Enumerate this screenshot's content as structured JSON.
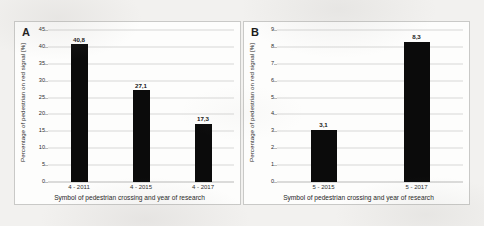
{
  "figure": {
    "background_color": "#f2f1ef",
    "bar_color": "#0b0b0b",
    "grid_color": "#d8d8d6"
  },
  "panels": [
    {
      "letter": "A",
      "ytitle": "Percentage of pedestrian on red signal [%]",
      "xtitle": "Symbol of pedestrian crossing and year of research"
    },
    {
      "letter": "B",
      "ytitle": "Percentage of pedestrian on red signal [%]",
      "xtitle": "Symbol of pedestrian crossing and year of research"
    }
  ],
  "chart_data": [
    {
      "type": "bar",
      "panel": "A",
      "title": "",
      "categories": [
        "4 - 2011",
        "4 - 2015",
        "4 - 2017"
      ],
      "values": [
        40.8,
        27.1,
        17.3
      ],
      "data_labels": [
        "40,8",
        "27,1",
        "17,3"
      ],
      "xlabel": "Symbol of pedestrian crossing and year of research",
      "ylabel": "Percentage of pedestrian on red signal [%]",
      "ylim": [
        0,
        45
      ],
      "ytick_step": 5,
      "yticks": [
        0,
        5,
        10,
        15,
        20,
        25,
        30,
        35,
        40,
        45
      ],
      "ytick_labels": [
        "0",
        "5",
        "10",
        "15",
        "20",
        "25",
        "30",
        "35",
        "40",
        "45"
      ],
      "grid": true,
      "grid_axis": "y",
      "legend": false,
      "decimal_separator": ","
    },
    {
      "type": "bar",
      "panel": "B",
      "title": "",
      "categories": [
        "5 - 2015",
        "5 - 2017"
      ],
      "values": [
        3.1,
        8.3
      ],
      "data_labels": [
        "3,1",
        "8,3"
      ],
      "xlabel": "Symbol of pedestrian crossing and year of research",
      "ylabel": "Percentage of pedestrian on red signal [%]",
      "ylim": [
        0,
        9
      ],
      "ytick_step": 1,
      "yticks": [
        0,
        1,
        2,
        3,
        4,
        5,
        6,
        7,
        8,
        9
      ],
      "ytick_labels": [
        "0",
        "1",
        "2",
        "3",
        "4",
        "5",
        "6",
        "7",
        "8",
        "9"
      ],
      "grid": true,
      "grid_axis": "y",
      "legend": false,
      "decimal_separator": ","
    }
  ]
}
